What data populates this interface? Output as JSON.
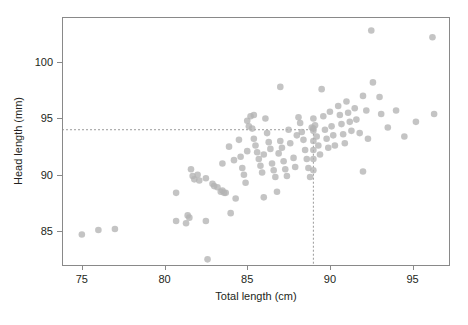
{
  "chart_data": {
    "type": "scatter",
    "title": "",
    "xlabel": "Total length (cm)",
    "ylabel": "Head length (mm)",
    "xlim": [
      73.8,
      97.2
    ],
    "ylim": [
      82.0,
      104.0
    ],
    "xticks": [
      75,
      80,
      85,
      90,
      95
    ],
    "yticks": [
      85,
      90,
      95,
      100
    ],
    "xtick_labels": [
      "75",
      "80",
      "85",
      "90",
      "95"
    ],
    "ytick_labels": [
      "85",
      "90",
      "95",
      "100"
    ],
    "grid": false,
    "legend": null,
    "point_color": "#b4b4b4",
    "reference_lines": [
      {
        "orientation": "horizontal",
        "value": 94.0,
        "style": "dashed",
        "color": "#9a9a9a"
      },
      {
        "orientation": "vertical",
        "value": 89.0,
        "style": "dashed",
        "color": "#9a9a9a"
      }
    ],
    "points": [
      [
        75.0,
        84.7
      ],
      [
        76.0,
        85.1
      ],
      [
        77.0,
        85.2
      ],
      [
        80.7,
        88.4
      ],
      [
        80.7,
        85.9
      ],
      [
        81.3,
        85.7
      ],
      [
        81.4,
        86.4
      ],
      [
        81.5,
        86.2
      ],
      [
        81.6,
        90.5
      ],
      [
        81.7,
        89.9
      ],
      [
        81.8,
        89.6
      ],
      [
        82.0,
        90.0
      ],
      [
        82.1,
        89.5
      ],
      [
        82.5,
        89.7
      ],
      [
        82.5,
        85.9
      ],
      [
        82.6,
        82.5
      ],
      [
        82.9,
        89.2
      ],
      [
        83.0,
        89.0
      ],
      [
        83.2,
        88.9
      ],
      [
        83.4,
        88.5
      ],
      [
        83.5,
        88.6
      ],
      [
        83.6,
        88.4
      ],
      [
        83.7,
        88.4
      ],
      [
        83.9,
        92.5
      ],
      [
        84.0,
        86.6
      ],
      [
        84.2,
        91.3
      ],
      [
        84.5,
        93.1
      ],
      [
        84.6,
        91.6
      ],
      [
        84.7,
        90.6
      ],
      [
        84.8,
        90.0
      ],
      [
        84.9,
        89.3
      ],
      [
        85.0,
        94.8
      ],
      [
        85.0,
        92.1
      ],
      [
        85.1,
        94.3
      ],
      [
        85.2,
        95.2
      ],
      [
        85.3,
        94.1
      ],
      [
        85.4,
        93.2
      ],
      [
        85.5,
        92.6
      ],
      [
        85.6,
        92.0
      ],
      [
        85.7,
        91.4
      ],
      [
        85.8,
        90.8
      ],
      [
        85.9,
        90.2
      ],
      [
        86.0,
        91.8
      ],
      [
        86.0,
        88.0
      ],
      [
        86.2,
        93.7
      ],
      [
        86.3,
        92.9
      ],
      [
        86.4,
        92.3
      ],
      [
        86.5,
        91.0
      ],
      [
        86.6,
        90.4
      ],
      [
        86.7,
        89.8
      ],
      [
        86.8,
        88.5
      ],
      [
        86.9,
        91.9
      ],
      [
        87.0,
        97.8
      ],
      [
        87.0,
        93.0
      ],
      [
        87.1,
        92.4
      ],
      [
        87.2,
        91.2
      ],
      [
        87.3,
        90.5
      ],
      [
        87.4,
        89.9
      ],
      [
        87.5,
        94.0
      ],
      [
        87.6,
        92.8
      ],
      [
        87.8,
        91.5
      ],
      [
        87.9,
        90.7
      ],
      [
        88.0,
        93.5
      ],
      [
        88.1,
        95.1
      ],
      [
        88.2,
        94.6
      ],
      [
        88.3,
        93.8
      ],
      [
        88.4,
        93.1
      ],
      [
        88.5,
        92.2
      ],
      [
        88.6,
        91.4
      ],
      [
        88.7,
        90.6
      ],
      [
        88.8,
        89.8
      ],
      [
        88.9,
        94.2
      ],
      [
        89.0,
        95.0
      ],
      [
        89.0,
        94.1
      ],
      [
        89.0,
        93.9
      ],
      [
        89.0,
        93.0
      ],
      [
        89.0,
        92.2
      ],
      [
        89.0,
        91.4
      ],
      [
        89.0,
        90.4
      ],
      [
        89.1,
        94.4
      ],
      [
        89.2,
        93.4
      ],
      [
        89.3,
        92.6
      ],
      [
        89.4,
        91.8
      ],
      [
        89.5,
        97.6
      ],
      [
        89.6,
        95.2
      ],
      [
        89.7,
        94.0
      ],
      [
        89.8,
        93.2
      ],
      [
        89.9,
        92.4
      ],
      [
        90.0,
        95.6
      ],
      [
        90.1,
        94.3
      ],
      [
        90.2,
        93.5
      ],
      [
        90.3,
        92.6
      ],
      [
        90.5,
        96.1
      ],
      [
        90.6,
        95.3
      ],
      [
        90.7,
        94.5
      ],
      [
        90.8,
        93.6
      ],
      [
        90.9,
        92.8
      ],
      [
        91.0,
        96.5
      ],
      [
        91.1,
        95.5
      ],
      [
        91.2,
        94.7
      ],
      [
        91.3,
        93.9
      ],
      [
        91.5,
        95.9
      ],
      [
        91.6,
        94.9
      ],
      [
        91.8,
        93.7
      ],
      [
        92.0,
        97.0
      ],
      [
        92.0,
        90.3
      ],
      [
        92.2,
        95.7
      ],
      [
        92.3,
        93.2
      ],
      [
        92.5,
        102.8
      ],
      [
        92.6,
        98.2
      ],
      [
        93.0,
        96.9
      ],
      [
        93.1,
        95.4
      ],
      [
        93.5,
        94.2
      ],
      [
        94.0,
        95.7
      ],
      [
        94.5,
        93.4
      ],
      [
        95.2,
        94.7
      ],
      [
        96.2,
        102.2
      ],
      [
        96.3,
        95.4
      ],
      [
        85.4,
        95.3
      ],
      [
        86.1,
        95.0
      ],
      [
        83.5,
        91.0
      ],
      [
        84.3,
        87.9
      ]
    ]
  },
  "layout": {
    "plot_left": 62,
    "plot_right": 449,
    "plot_top": 17,
    "plot_bottom": 265
  }
}
